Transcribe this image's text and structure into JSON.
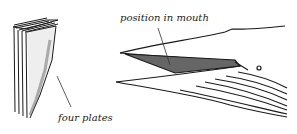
{
  "labels": {
    "plates": "four plates",
    "mouth": "position in mouth"
  },
  "colors": {
    "ink": "#1a1a1a",
    "fill": "#555555",
    "background": "#ffffff"
  }
}
